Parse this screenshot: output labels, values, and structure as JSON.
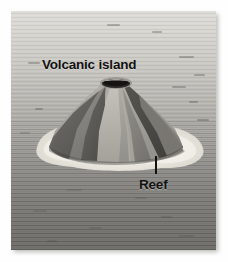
{
  "figure": {
    "kind": "scientific-illustration",
    "palette": {
      "page_background": "#ffffff",
      "sea_horizon": "#dedcd8",
      "sea_foreground": "#6b6965",
      "reef_foam": "#ece9e1",
      "island_light_face": "#a9a7a1",
      "island_mid_face": "#8d8b86",
      "island_dark_face": "#605e5a",
      "island_shadow_face": "#4b4946",
      "crater": "#211f1d",
      "label_text": "#111110"
    },
    "labels": [
      {
        "id": "volcanic-island",
        "text": "Volcanic island",
        "x": 31,
        "y": 46,
        "leader": false
      },
      {
        "id": "reef",
        "text": "Reef",
        "x": 128,
        "y": 166,
        "leader": true,
        "leader_x": 144,
        "leader_y": 145,
        "leader_length": 18
      }
    ],
    "sea": {
      "gradient_from": "#dedcd8",
      "gradient_to": "#6b6965",
      "wave_marks": [
        {
          "x": 96,
          "y": 13,
          "w": 13
        },
        {
          "x": 141,
          "y": 20,
          "w": 10
        },
        {
          "x": 168,
          "y": 45,
          "w": 15
        },
        {
          "x": 17,
          "y": 51,
          "w": 12
        },
        {
          "x": 183,
          "y": 63,
          "w": 11
        },
        {
          "x": 161,
          "y": 75,
          "w": 14
        },
        {
          "x": 178,
          "y": 90,
          "w": 9
        },
        {
          "x": 24,
          "y": 97,
          "w": 8
        },
        {
          "x": 186,
          "y": 108,
          "w": 12
        },
        {
          "x": 9,
          "y": 121,
          "w": 10
        },
        {
          "x": 172,
          "y": 130,
          "w": 9
        },
        {
          "x": 55,
          "y": 178,
          "w": 16
        },
        {
          "x": 124,
          "y": 186,
          "w": 12
        },
        {
          "x": 22,
          "y": 199,
          "w": 14
        },
        {
          "x": 150,
          "y": 205,
          "w": 11
        },
        {
          "x": 78,
          "y": 216,
          "w": 13
        },
        {
          "x": 168,
          "y": 224,
          "w": 15
        },
        {
          "x": 36,
          "y": 229,
          "w": 10
        }
      ]
    },
    "island": {
      "crater_center_x": 105,
      "crater_center_y": 73,
      "crater_rx": 14,
      "crater_ry": 4,
      "base_left_x": 29,
      "base_right_x": 186,
      "base_y": 142,
      "reef_left_x": 24,
      "reef_right_x": 192,
      "reef_bottom_y": 152
    }
  }
}
